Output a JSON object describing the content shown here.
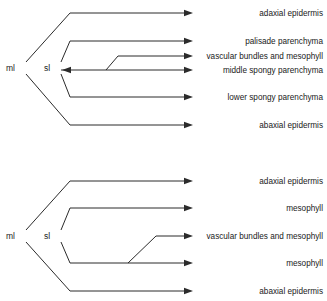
{
  "figure": {
    "type": "tree-diagram",
    "line_color": "#2b2b2b",
    "text_color": "#1a1a1a",
    "background": "#ffffff"
  },
  "diagrams": [
    {
      "id": "upper",
      "nodes": [
        {
          "key": "ml",
          "label": "ml",
          "x": 14,
          "y": 68
        },
        {
          "key": "sl",
          "label": "sl",
          "x": 51,
          "y": 68
        }
      ],
      "leaves": [
        {
          "key": "adaxial-epidermis-upper",
          "label": "adaxial epidermis",
          "y": 13,
          "parent": "sl"
        },
        {
          "key": "palisade-parenchyma",
          "label": "palisade parenchyma",
          "y": 41,
          "parent": "sl"
        },
        {
          "key": "vascular-bundles-and-mesophyll-upper",
          "label": "vascular bundles and mesophyll",
          "y": 56,
          "parent": "middle-spongy-parenchyma"
        },
        {
          "key": "middle-spongy-parenchyma",
          "label": "middle spongy parenchyma",
          "y": 70,
          "parent": "sl"
        },
        {
          "key": "lower-spongy-parenchyma",
          "label": "lower spongy parenchyma",
          "y": 97,
          "parent": "sl"
        },
        {
          "key": "abaxial-epidermis-upper",
          "label": "abaxial epidermis",
          "y": 125,
          "parent": "ml"
        }
      ]
    },
    {
      "id": "lower",
      "nodes": [
        {
          "key": "ml",
          "label": "ml",
          "x": 14,
          "y": 236
        },
        {
          "key": "sl",
          "label": "sl",
          "x": 51,
          "y": 236
        }
      ],
      "leaves": [
        {
          "key": "adaxial-epidermis-lower",
          "label": "adaxial epidermis",
          "y": 181,
          "parent": "sl"
        },
        {
          "key": "mesophyll-upper",
          "label": "mesophyll",
          "y": 208,
          "parent": "sl"
        },
        {
          "key": "vascular-bundles-and-mesophyll-lower",
          "label": "vascular bundles and mesophyll",
          "y": 236,
          "parent": "mesophyll-lower"
        },
        {
          "key": "mesophyll-lower",
          "label": "mesophyll",
          "y": 263,
          "parent": "sl"
        },
        {
          "key": "abaxial-epidermis-lower",
          "label": "abaxial epidermis",
          "y": 291,
          "parent": "ml"
        }
      ]
    }
  ],
  "labels": {
    "ml": "ml",
    "sl": "sl",
    "adaxial_epidermis": "adaxial epidermis",
    "palisade_parenchyma": "palisade parenchyma",
    "vascular_bundles_and_mesophyll": "vascular bundles and mesophyll",
    "middle_spongy_parenchyma": "middle spongy parenchyma",
    "lower_spongy_parenchyma": "lower spongy parenchyma",
    "abaxial_epidermis": "abaxial epidermis",
    "mesophyll": "mesophyll"
  },
  "geometry": {
    "label_right_edge": 323,
    "arrow_tip_x": 193,
    "bend_x_outer": 70,
    "bend_x_inner": 64,
    "vascular_bend_x": 118,
    "vascular_bend_x_lower": 140
  }
}
